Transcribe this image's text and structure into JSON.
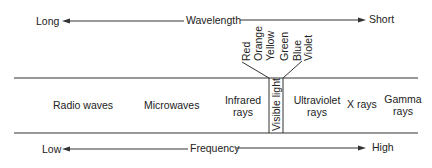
{
  "wavelength_axis": {
    "left": "Long",
    "center": "Wavelength",
    "right": "Short"
  },
  "frequency_axis": {
    "left": "Low",
    "center": "Frequency",
    "right": "High"
  },
  "regions": [
    {
      "label": "Radio waves"
    },
    {
      "label": "Microwaves"
    },
    {
      "label_line1": "Infrared",
      "label_line2": "rays"
    },
    {
      "label": "Visible light"
    },
    {
      "label_line1": "Ultraviolet",
      "label_line2": "rays"
    },
    {
      "label": "X rays"
    },
    {
      "label_line1": "Gamma",
      "label_line2": "rays"
    }
  ],
  "visible_colors": [
    "Red",
    "Orange",
    "Yellow",
    "Green",
    "Blue",
    "Violet"
  ],
  "line_color": "#333333"
}
